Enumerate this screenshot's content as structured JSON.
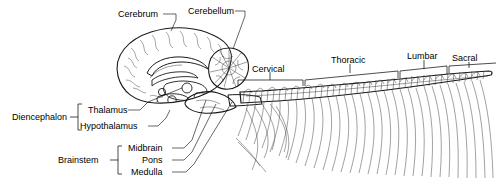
{
  "figure": {
    "background_color": "#ffffff",
    "ink_color": "#000000",
    "fill_gray": "#d5d5d5",
    "cord_gray": "#e8e8e8"
  },
  "labels": {
    "cerebrum": "Cerebrum",
    "cerebellum": "Cerebellum",
    "diencephalon": "Diencephalon",
    "thalamus": "Thalamus",
    "hypothalamus": "Hypothalamus",
    "brainstem": "Brainstem",
    "midbrain": "Midbrain",
    "pons": "Pons",
    "medulla": "Medulla",
    "cervical": "Cervical",
    "thoracic": "Thoracic",
    "lumbar": "Lumbar",
    "sacral": "Sacral"
  },
  "groups": {
    "diencephalon_members": [
      "Thalamus",
      "Hypothalamus"
    ],
    "brainstem_members": [
      "Midbrain",
      "Pons",
      "Medulla"
    ],
    "spinal_regions": [
      "Cervical",
      "Thoracic",
      "Lumbar",
      "Sacral"
    ]
  }
}
